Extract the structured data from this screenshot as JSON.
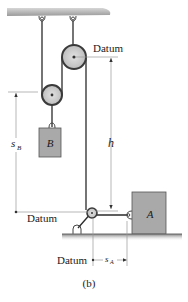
{
  "figure": {
    "caption": "(b)",
    "labels": {
      "datum_top": "Datum",
      "datum_left": "Datum",
      "datum_bottom": "Datum",
      "h": "h",
      "s_B_main": "s",
      "s_B_sub": "B",
      "s_A_main": "s",
      "s_A_sub": "A",
      "block_B": "B",
      "block_A": "A"
    },
    "colors": {
      "ceiling": "#a8a8a8",
      "pulley_fill": "#c8c8c8",
      "pulley_rim": "#3a3a3a",
      "block_fill": "#a9a9a9",
      "block_edge": "#555555",
      "cable": "#2a2a2a",
      "dimension_line": "#9a9a9a",
      "ground": "#8c8c8c"
    }
  }
}
